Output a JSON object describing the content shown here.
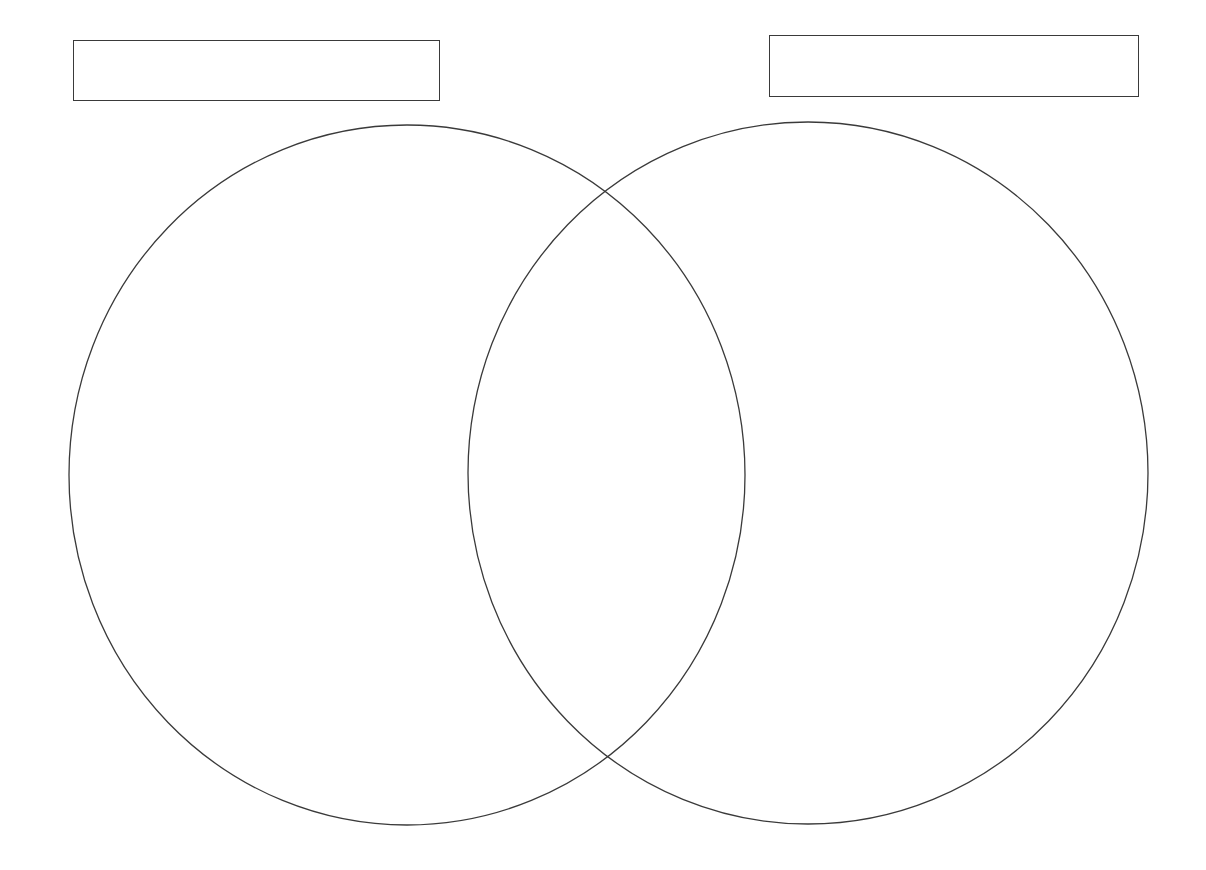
{
  "diagram": {
    "type": "venn",
    "sets": [
      {
        "id": "left",
        "label": "",
        "label_box": {
          "x": 73,
          "y": 40,
          "width": 367,
          "height": 61
        },
        "ellipse": {
          "cx": 407,
          "cy": 475,
          "rx": 338,
          "ry": 350
        }
      },
      {
        "id": "right",
        "label": "",
        "label_box": {
          "x": 769,
          "y": 35,
          "width": 370,
          "height": 62
        },
        "ellipse": {
          "cx": 808,
          "cy": 473,
          "rx": 340,
          "ry": 351
        }
      }
    ],
    "stroke_color": "#3a3a3a",
    "background_color": "#ffffff"
  }
}
